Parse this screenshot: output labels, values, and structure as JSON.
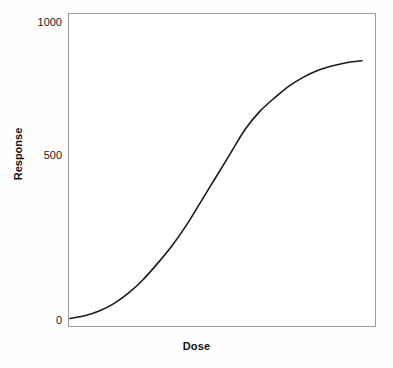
{
  "chart_data": {
    "type": "line",
    "title": "",
    "xlabel": "Dose",
    "ylabel": "Response",
    "grid": false,
    "legend": false,
    "ylim": [
      0,
      1000
    ],
    "ytick_labels": [
      "1000",
      "500",
      "0"
    ],
    "ytick_values": [
      1000,
      500,
      0
    ],
    "xtick_labels": [],
    "axis_note": "x axis unlabeled (no tick values); sigmoid dose-response curve",
    "series": [
      {
        "name": "dose-response",
        "color": "#1a1a1a",
        "x": [
          0,
          5,
          10,
          15,
          20,
          25,
          30,
          35,
          40,
          45,
          50,
          55,
          60,
          65,
          70,
          75,
          80,
          85,
          90,
          95,
          100
        ],
        "y": [
          5,
          14,
          30,
          55,
          90,
          135,
          190,
          250,
          320,
          400,
          480,
          560,
          640,
          700,
          745,
          785,
          815,
          838,
          853,
          864,
          870
        ]
      }
    ]
  },
  "labels": {
    "y_top": "1000",
    "y_mid": "500",
    "y_bottom": "0",
    "x_axis_title": "Dose",
    "y_axis_title": "Response"
  },
  "colors": {
    "curve": "#1a1a1a",
    "frame": "#9d9d9d",
    "text": "#111111",
    "background": "#fefefe"
  }
}
